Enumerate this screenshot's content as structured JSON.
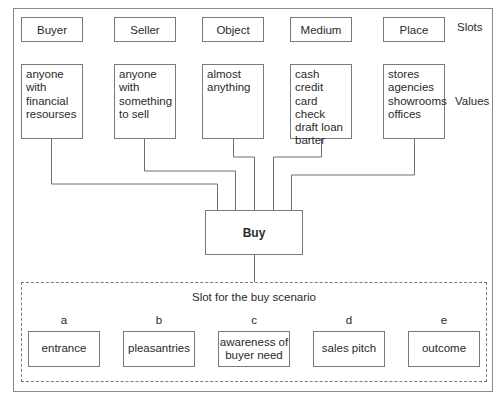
{
  "diagram": {
    "row_labels": {
      "slots": "Slots",
      "values": "Values"
    },
    "slots": [
      {
        "name": "Buyer",
        "values": "anyone\nwith\nfinancial\nresourses"
      },
      {
        "name": "Seller",
        "values": "anyone\nwith\nsomething\nto sell"
      },
      {
        "name": "Object",
        "values": "almost\nanything"
      },
      {
        "name": "Medium",
        "values": "cash\ncredit card\ncheck\ndraft loan\nbarter"
      },
      {
        "name": "Place",
        "values": "stores\nagencies\nshowrooms\noffices"
      }
    ],
    "center": {
      "label": "Buy"
    },
    "scenario": {
      "title": "Slot for the buy scenario",
      "steps": [
        {
          "letter": "a",
          "label": "entrance"
        },
        {
          "letter": "b",
          "label": "pleasantries"
        },
        {
          "letter": "c",
          "label": "awareness of\nbuyer need"
        },
        {
          "letter": "d",
          "label": "sales pitch"
        },
        {
          "letter": "e",
          "label": "outcome"
        }
      ]
    }
  }
}
